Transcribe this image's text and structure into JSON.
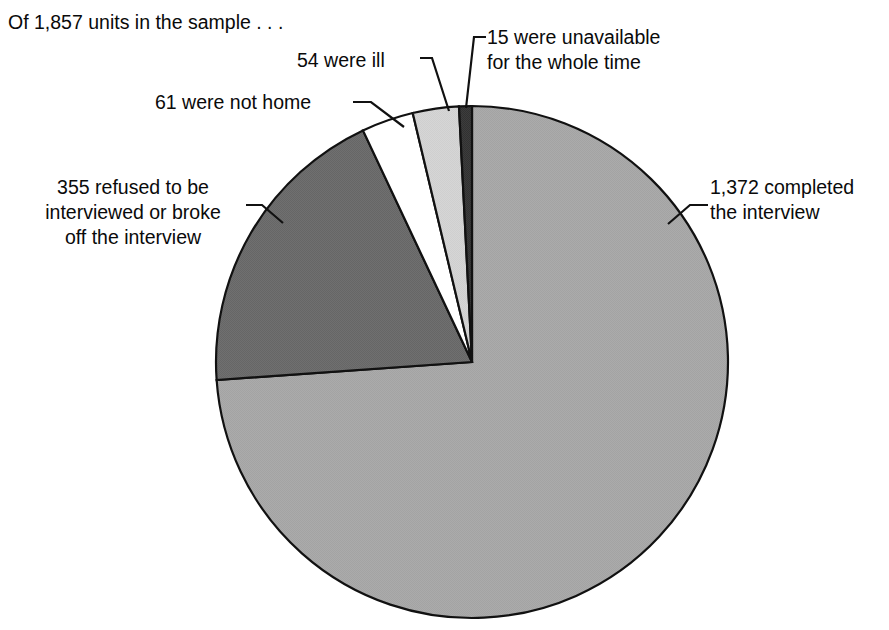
{
  "figure": {
    "caption": "Of 1,857 units in the sample . . .",
    "background_color": "#ffffff",
    "outline_color": "#000000"
  },
  "chart_data": {
    "type": "pie",
    "title": "Of 1,857 units in the sample . . .",
    "total": 1857,
    "total_label": "1,857",
    "units_label": "units in the sample",
    "legend_position": "none",
    "labels_position": "outside-with-leader-lines",
    "start_angle_deg": 0,
    "direction": "clockwise",
    "categories": [
      "completed the interview",
      "refused to be interviewed or broke off the interview",
      "were not home",
      "were ill",
      "were unavailable for the whole time"
    ],
    "values": [
      1372,
      355,
      61,
      54,
      15
    ],
    "percentages": [
      73.88,
      19.12,
      3.28,
      2.91,
      0.81
    ],
    "colors": [
      "#a8a8a8",
      "#6b6b6b",
      "#ffffff",
      "#d4d4d4",
      "#3a3a3a"
    ],
    "slices": [
      {
        "key": "completed",
        "value": 1372,
        "value_label": "1,372",
        "text_line1": "1,372 completed",
        "text_line2": "the interview",
        "full_text": "1,372 completed the interview",
        "percent": 73.88,
        "color": "#a8a8a8",
        "start_deg": 0,
        "sweep_deg": 265.97
      },
      {
        "key": "refused",
        "value": 355,
        "value_label": "355",
        "text_line1": "355 refused to be",
        "text_line2": "interviewed or broke",
        "text_line3": "off the interview",
        "full_text": "355 refused to be interviewed or broke off the interview",
        "percent": 19.12,
        "color": "#6b6b6b",
        "start_deg": 265.97,
        "sweep_deg": 68.82
      },
      {
        "key": "not-home",
        "value": 61,
        "value_label": "61",
        "text_line1": "61 were not home",
        "full_text": "61 were not home",
        "percent": 3.28,
        "color": "#ffffff",
        "start_deg": 334.79,
        "sweep_deg": 11.82
      },
      {
        "key": "ill",
        "value": 54,
        "value_label": "54",
        "text_line1": "54 were ill",
        "full_text": "54 were ill",
        "percent": 2.91,
        "color": "#d4d4d4",
        "start_deg": 346.61,
        "sweep_deg": 10.47
      },
      {
        "key": "unavailable",
        "value": 15,
        "value_label": "15",
        "text_line1": "15 were unavailable",
        "text_line2": "for the whole time",
        "full_text": "15 were unavailable for the whole time",
        "percent": 0.81,
        "color": "#3a3a3a",
        "start_deg": 357.09,
        "sweep_deg": 2.91
      }
    ],
    "xlabel": "",
    "ylabel": "",
    "grid": false
  },
  "labels": {
    "caption": "Of 1,857 units in the sample . . .",
    "ill": "54 were ill",
    "unavailable_line1": "15 were unavailable",
    "unavailable_line2": "for the whole time",
    "not_home": "61 were not home",
    "refused_line1": "355 refused to be",
    "refused_line2": "interviewed or broke",
    "refused_line3": "off the interview",
    "completed_line1": "1,372 completed",
    "completed_line2": "the interview"
  }
}
